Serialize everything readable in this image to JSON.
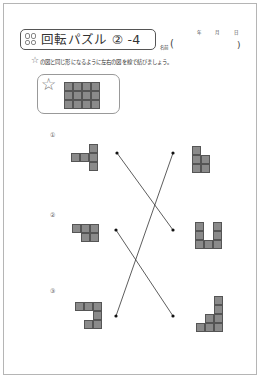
{
  "header": {
    "title": "回転パズル ② -4",
    "title_icon": "puzzle-grid-icon",
    "name_label": "名前",
    "name_paren_open": "(",
    "name_paren_close": ")",
    "date_year": "年",
    "date_month": "月",
    "date_day": "日"
  },
  "instruction": {
    "star_icon": "☆",
    "text": "の図と同じ形になるように左右の図を線で結びましょう。"
  },
  "example": {
    "star_icon": "☆",
    "grid": {
      "cols": 4,
      "rows": 3
    }
  },
  "problems": [
    {
      "number": "①"
    },
    {
      "number": "②"
    },
    {
      "number": "③"
    }
  ],
  "connections": [
    {
      "from_left": 1,
      "to_right": 2
    },
    {
      "from_left": 2,
      "to_right": 3
    },
    {
      "from_left": 3,
      "to_right": 1
    }
  ],
  "colors": {
    "cell_fill": "#8a8a8a",
    "cell_border": "#555555",
    "line": "#333333",
    "frame": "#b5b5b5"
  }
}
